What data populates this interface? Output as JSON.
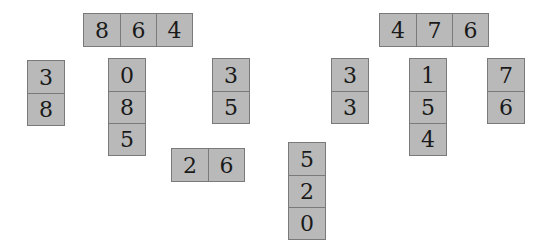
{
  "groups": [
    {
      "id": "g1",
      "orientation": "h",
      "x": 83,
      "y": 13,
      "digits": [
        "8",
        "6",
        "4"
      ]
    },
    {
      "id": "g2",
      "orientation": "h",
      "x": 379,
      "y": 13,
      "digits": [
        "4",
        "7",
        "6"
      ]
    },
    {
      "id": "g3",
      "orientation": "v",
      "x": 27,
      "y": 60,
      "digits": [
        "3",
        "8"
      ]
    },
    {
      "id": "g4",
      "orientation": "v",
      "x": 108,
      "y": 58,
      "digits": [
        "0",
        "8",
        "5"
      ]
    },
    {
      "id": "g5",
      "orientation": "v",
      "x": 212,
      "y": 58,
      "digits": [
        "3",
        "5"
      ]
    },
    {
      "id": "g6",
      "orientation": "h",
      "x": 171,
      "y": 148,
      "digits": [
        "2",
        "6"
      ]
    },
    {
      "id": "g7",
      "orientation": "v",
      "x": 288,
      "y": 142,
      "digits": [
        "5",
        "2",
        "0"
      ]
    },
    {
      "id": "g8",
      "orientation": "v",
      "x": 331,
      "y": 58,
      "digits": [
        "3",
        "3"
      ]
    },
    {
      "id": "g9",
      "orientation": "v",
      "x": 409,
      "y": 58,
      "digits": [
        "1",
        "5",
        "4"
      ]
    },
    {
      "id": "g10",
      "orientation": "v",
      "x": 487,
      "y": 58,
      "digits": [
        "7",
        "6"
      ]
    }
  ]
}
